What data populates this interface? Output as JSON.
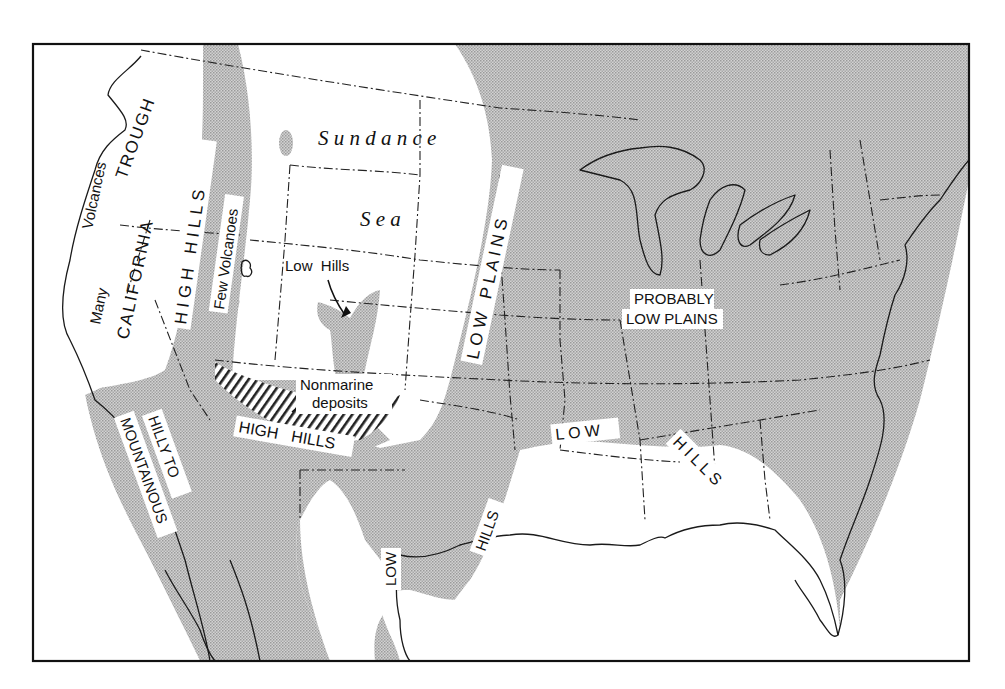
{
  "map": {
    "subject": "Jurassic paleogeography of the United States",
    "colors": {
      "land_shaded": "#c4c4c4",
      "sea_unshaded": "#ffffff",
      "lines": "#1a1a1a",
      "frame": "#111111"
    },
    "legend_implied": {
      "shaded": "Land areas",
      "white": "Sea / marine areas",
      "hatched": "Nonmarine deposits"
    },
    "labels": {
      "many": "Many",
      "volcances": "Volcances",
      "california_trough_1": "CALIFORNIA",
      "california_trough_2": "TROUGH",
      "high_hills_north": "H I G H   H I L L S",
      "few_volcanoes": "Few Volcanoes",
      "sundance": "S u n d a n c e",
      "sea": "S e a",
      "low_hills": "Low  Hills",
      "low_plains": "L O W   P L A I N S",
      "probably_1": "PROBABLY",
      "probably_2": "LOW PLAINS",
      "nonmarine_1": "Nonmarine",
      "nonmarine_2": "deposits",
      "high_hills_south": "HIGH   HILLS",
      "hilly_to": "HILLY TO",
      "mountainous": "MOUNTAINOUS",
      "low_gulf": "L O W",
      "hills_gulf": "H I L L S",
      "hills_texas": "HILLS",
      "low_mexico": "LOW"
    }
  }
}
